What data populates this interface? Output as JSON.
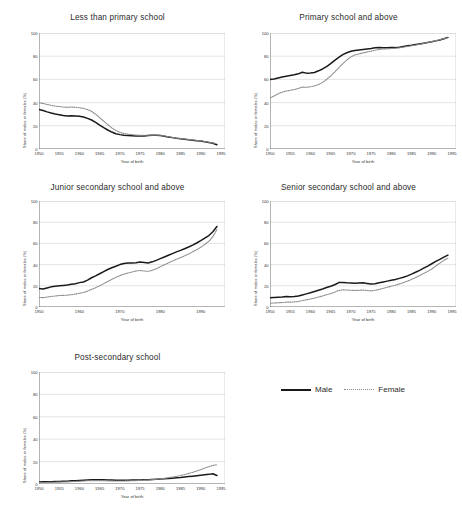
{
  "figure": {
    "legend": {
      "male_label": "Male",
      "female_label": "Female",
      "male_style": "solid",
      "female_style": "dotted",
      "male_color": "#1a1a1a",
      "female_color": "#8a8a8a"
    }
  },
  "chart_data": [
    {
      "type": "line",
      "title": "Less than primary school",
      "xlabel": "Year of birth",
      "ylabel": "Share of males or females (%)",
      "xlim": [
        1950,
        1996
      ],
      "ylim": [
        0,
        100
      ],
      "xticks": [
        1950,
        1955,
        1960,
        1965,
        1970,
        1975,
        1980,
        1985,
        1990,
        1995
      ],
      "yticks": [
        0,
        20,
        40,
        60,
        80,
        100
      ],
      "grid": true,
      "legend_position": "external-right",
      "x": [
        1950,
        1951,
        1952,
        1953,
        1954,
        1955,
        1956,
        1957,
        1958,
        1959,
        1960,
        1961,
        1962,
        1963,
        1964,
        1965,
        1966,
        1967,
        1968,
        1969,
        1970,
        1971,
        1972,
        1973,
        1974,
        1975,
        1976,
        1977,
        1978,
        1979,
        1980,
        1981,
        1982,
        1983,
        1984,
        1985,
        1986,
        1987,
        1988,
        1989,
        1990,
        1991,
        1992,
        1993,
        1994
      ],
      "series": [
        {
          "name": "Male",
          "values": [
            34,
            33.2,
            32,
            31,
            30.2,
            29.6,
            28.8,
            28.4,
            28.6,
            28.4,
            28.2,
            27.6,
            26.4,
            25,
            23,
            20.6,
            18.4,
            16.4,
            14.6,
            13.2,
            12.4,
            11.8,
            11.6,
            11.4,
            11.2,
            11.2,
            11.3,
            11.6,
            11.8,
            11.8,
            11.6,
            11,
            10.4,
            9.8,
            9.2,
            8.8,
            8.4,
            8,
            7.6,
            7.2,
            6.8,
            6.2,
            5.6,
            5,
            3.6
          ]
        },
        {
          "name": "Female",
          "values": [
            40,
            39.2,
            38.4,
            37.6,
            37,
            36.6,
            36.2,
            36,
            36.2,
            36,
            35.6,
            35,
            34,
            32.4,
            30,
            27,
            24,
            21,
            18.2,
            16,
            14.4,
            13.4,
            12.8,
            12.4,
            12,
            11.8,
            11.8,
            11.9,
            12,
            12,
            11.8,
            11.2,
            10.6,
            10,
            9.4,
            9,
            8.6,
            8.2,
            7.8,
            7.4,
            7,
            6.4,
            5.8,
            5.2,
            4.6
          ]
        }
      ]
    },
    {
      "type": "line",
      "title": "Primary school and above",
      "xlabel": "Year of birth",
      "ylabel": "Share of males or females (%)",
      "xlim": [
        1950,
        1996
      ],
      "ylim": [
        0,
        100
      ],
      "xticks": [
        1950,
        1955,
        1960,
        1965,
        1970,
        1975,
        1980,
        1985,
        1990,
        1995
      ],
      "yticks": [
        0,
        20,
        40,
        60,
        80,
        100
      ],
      "grid": true,
      "legend_position": "external-right",
      "x": [
        1950,
        1951,
        1952,
        1953,
        1954,
        1955,
        1956,
        1957,
        1958,
        1959,
        1960,
        1961,
        1962,
        1963,
        1964,
        1965,
        1966,
        1967,
        1968,
        1969,
        1970,
        1971,
        1972,
        1973,
        1974,
        1975,
        1976,
        1977,
        1978,
        1979,
        1980,
        1981,
        1982,
        1983,
        1984,
        1985,
        1986,
        1987,
        1988,
        1989,
        1990,
        1991,
        1992,
        1993,
        1994
      ],
      "series": [
        {
          "name": "Male",
          "values": [
            60,
            60.4,
            61.2,
            62,
            62.8,
            63.4,
            64,
            64.8,
            66.2,
            65.4,
            65.6,
            66,
            67.4,
            69,
            71,
            73.6,
            76.4,
            79,
            81.4,
            83,
            84.2,
            85,
            85.4,
            85.8,
            86.2,
            86.6,
            87.2,
            87.4,
            87.2,
            87.2,
            87.4,
            87.4,
            87.8,
            88.4,
            89,
            89.4,
            90,
            90.6,
            91.2,
            91.8,
            92.4,
            93.2,
            94,
            95,
            96.2
          ]
        },
        {
          "name": "Female",
          "values": [
            44,
            45.6,
            47.6,
            49,
            50,
            50.6,
            51.2,
            52.2,
            53.4,
            53.2,
            53.6,
            54.4,
            55.6,
            57.4,
            60,
            63,
            66.4,
            70,
            73.6,
            76.8,
            79.4,
            81,
            82,
            82.8,
            83.6,
            84.4,
            85.2,
            85.8,
            86.2,
            86.4,
            86.6,
            86.8,
            87.2,
            87.8,
            88.4,
            89,
            89.6,
            90.2,
            91,
            91.8,
            92.6,
            93.4,
            94.2,
            95.2,
            96
          ]
        }
      ]
    },
    {
      "type": "line",
      "title": "Junior secondary school and above",
      "xlabel": "Year of birth",
      "ylabel": "Share of males or females (%)",
      "xlim": [
        1950,
        1996
      ],
      "ylim": [
        0,
        100
      ],
      "xticks": [
        1950,
        1960,
        1970,
        1980,
        1990
      ],
      "yticks": [
        0,
        20,
        40,
        60,
        80,
        100
      ],
      "grid": true,
      "legend_position": "external-right",
      "x": [
        1950,
        1951,
        1952,
        1953,
        1954,
        1955,
        1956,
        1957,
        1958,
        1959,
        1960,
        1961,
        1962,
        1963,
        1964,
        1965,
        1966,
        1967,
        1968,
        1969,
        1970,
        1971,
        1972,
        1973,
        1974,
        1975,
        1976,
        1977,
        1978,
        1979,
        1980,
        1981,
        1982,
        1983,
        1984,
        1985,
        1986,
        1987,
        1988,
        1989,
        1990,
        1991,
        1992,
        1993,
        1994
      ],
      "series": [
        {
          "name": "Male",
          "values": [
            17.4,
            17,
            18,
            19,
            19.6,
            20,
            20.4,
            20.8,
            21.4,
            22,
            23,
            23.6,
            25.4,
            27.6,
            29.4,
            31.4,
            33.4,
            35.4,
            37,
            38.4,
            40,
            41,
            41.4,
            41.4,
            41.8,
            42.4,
            42,
            41.6,
            42.6,
            44,
            45.6,
            47.2,
            48.8,
            50.4,
            52,
            53.4,
            55,
            56.6,
            58.4,
            60.4,
            62.6,
            65,
            67.4,
            71,
            76
          ]
        },
        {
          "name": "Female",
          "values": [
            9,
            8.8,
            9.4,
            10,
            10.4,
            10.8,
            11,
            11.2,
            11.6,
            12.2,
            13,
            13.6,
            15,
            16.6,
            18.2,
            20,
            22,
            24,
            26,
            28,
            29.6,
            31,
            32,
            33,
            34,
            34.4,
            34,
            33.6,
            34.6,
            36,
            38,
            39.8,
            41.6,
            43.4,
            45,
            46.6,
            48.2,
            50,
            52,
            54,
            56.4,
            59,
            62,
            66.4,
            73
          ]
        }
      ]
    },
    {
      "type": "line",
      "title": "Senior secondary school and above",
      "xlabel": "Year of birth",
      "ylabel": "Share of males or females (%)",
      "xlim": [
        1950,
        1996
      ],
      "ylim": [
        0,
        100
      ],
      "xticks": [
        1950,
        1955,
        1960,
        1965,
        1970,
        1975,
        1980,
        1985,
        1990,
        1995
      ],
      "yticks": [
        0,
        20,
        40,
        60,
        80,
        100
      ],
      "grid": true,
      "legend_position": "external-right",
      "x": [
        1950,
        1951,
        1952,
        1953,
        1954,
        1955,
        1956,
        1957,
        1958,
        1959,
        1960,
        1961,
        1962,
        1963,
        1964,
        1965,
        1966,
        1967,
        1968,
        1969,
        1970,
        1971,
        1972,
        1973,
        1974,
        1975,
        1976,
        1977,
        1978,
        1979,
        1980,
        1981,
        1982,
        1983,
        1984,
        1985,
        1986,
        1987,
        1988,
        1989,
        1990,
        1991,
        1992,
        1993,
        1994
      ],
      "series": [
        {
          "name": "Male",
          "values": [
            8.8,
            9,
            9.2,
            9.4,
            9.8,
            9.6,
            9.8,
            10.4,
            11.4,
            12.4,
            13.4,
            14.6,
            15.8,
            17,
            18.4,
            19.6,
            21,
            23,
            23.2,
            22.8,
            22.6,
            22.4,
            22.6,
            22.8,
            22.2,
            21.6,
            22,
            22.8,
            23.6,
            24.4,
            25.2,
            26,
            27,
            28,
            29.4,
            31,
            32.8,
            34.6,
            36.6,
            38.6,
            40.8,
            43,
            45,
            47,
            49
          ]
        },
        {
          "name": "Female",
          "values": [
            3.6,
            3.8,
            4,
            4.2,
            4.6,
            4.6,
            4.8,
            5.2,
            6,
            6.8,
            7.6,
            8.4,
            9.4,
            10.4,
            11.6,
            12.6,
            14,
            15.6,
            16.2,
            16,
            15.8,
            15.6,
            15.8,
            16,
            15.6,
            15.2,
            15.8,
            16.6,
            17.6,
            18.6,
            19.6,
            20.6,
            21.8,
            23,
            24.4,
            26,
            27.8,
            29.6,
            31.6,
            33.6,
            35.8,
            38.6,
            41.4,
            44,
            46
          ]
        }
      ]
    },
    {
      "type": "line",
      "title": "Post-secondary school",
      "xlabel": "Year of birth",
      "ylabel": "Share of males or females (%)",
      "xlim": [
        1950,
        1996
      ],
      "ylim": [
        0,
        100
      ],
      "xticks": [
        1950,
        1955,
        1960,
        1965,
        1970,
        1975,
        1980,
        1985,
        1990,
        1995
      ],
      "yticks": [
        0,
        20,
        40,
        60,
        80,
        100
      ],
      "grid": true,
      "legend_position": "external-right",
      "x": [
        1950,
        1951,
        1952,
        1953,
        1954,
        1955,
        1956,
        1957,
        1958,
        1959,
        1960,
        1961,
        1962,
        1963,
        1964,
        1965,
        1966,
        1967,
        1968,
        1969,
        1970,
        1971,
        1972,
        1973,
        1974,
        1975,
        1976,
        1977,
        1978,
        1979,
        1980,
        1981,
        1982,
        1983,
        1984,
        1985,
        1986,
        1987,
        1988,
        1989,
        1990,
        1991,
        1992,
        1993,
        1994
      ],
      "series": [
        {
          "name": "Male",
          "values": [
            1.8,
            1.9,
            2,
            2.1,
            2.2,
            2.3,
            2.4,
            2.5,
            2.8,
            3,
            3.2,
            3.4,
            3.6,
            3.8,
            3.8,
            3.8,
            3.7,
            3.6,
            3.5,
            3.4,
            3.4,
            3.4,
            3.4,
            3.5,
            3.5,
            3.6,
            3.7,
            3.8,
            4,
            4.2,
            4.4,
            4.6,
            4.9,
            5.2,
            5.5,
            5.8,
            6.2,
            6.6,
            7,
            7.4,
            7.8,
            8.2,
            8.6,
            9.2,
            7.6
          ]
        },
        {
          "name": "Female",
          "values": [
            1.2,
            1.3,
            1.4,
            1.5,
            1.6,
            1.7,
            1.8,
            1.9,
            2.1,
            2.3,
            2.5,
            2.7,
            2.9,
            3,
            3,
            3,
            2.9,
            2.8,
            2.7,
            2.7,
            2.7,
            2.7,
            2.8,
            2.9,
            3,
            3.2,
            3.4,
            3.6,
            3.9,
            4.2,
            4.6,
            5,
            5.6,
            6.2,
            6.8,
            7.6,
            8.4,
            9.4,
            10.4,
            11.6,
            12.8,
            14.2,
            15.4,
            16.6,
            17.2
          ]
        }
      ]
    }
  ]
}
